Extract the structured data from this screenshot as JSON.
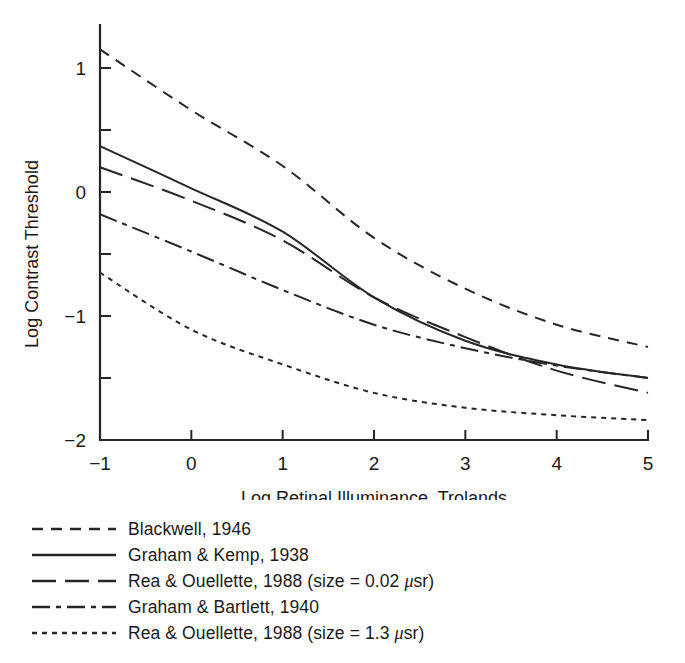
{
  "chart_data": {
    "type": "line",
    "title": "",
    "xlabel": "Log Retinal Illuminance, Trolands",
    "ylabel": "Log Contrast Threshold",
    "xlim": [
      -1,
      5
    ],
    "ylim": [
      -2,
      1
    ],
    "xticks": [
      "-1",
      "0",
      "1",
      "2",
      "3",
      "4",
      "5"
    ],
    "xtick_values": [
      -1,
      0,
      1,
      2,
      3,
      4,
      5
    ],
    "yticks": [
      "1",
      "0",
      "-1",
      "-2"
    ],
    "ytick_values": [
      1,
      0,
      -1,
      -2
    ],
    "yminor_values": [
      0.5,
      -0.5,
      -1.5
    ],
    "grid": false,
    "legend_position": "below",
    "x": [
      -1,
      0,
      1,
      2,
      3,
      4,
      5
    ],
    "series": [
      {
        "name": "Blackwell, 1946",
        "linestyle": "dashed",
        "dasharray": "11,8",
        "values": [
          1.15,
          0.66,
          0.21,
          -0.37,
          -0.78,
          -1.07,
          -1.25
        ]
      },
      {
        "name": "Graham & Kemp, 1938",
        "linestyle": "solid",
        "dasharray": "",
        "values": [
          0.37,
          0.03,
          -0.32,
          -0.85,
          -1.2,
          -1.39,
          -1.5
        ]
      },
      {
        "name": "Rea & Ouellette, 1988 (size = 0.02 µsr)",
        "linestyle": "long-dash",
        "dasharray": "24,9",
        "values": [
          0.2,
          -0.07,
          -0.39,
          -0.85,
          -1.17,
          -1.44,
          -1.62
        ]
      },
      {
        "name": "Graham & Bartlett, 1940",
        "linestyle": "dash-dot",
        "dasharray": "18,6,5,6",
        "values": [
          -0.18,
          -0.48,
          -0.79,
          -1.07,
          -1.26,
          -1.4,
          -1.5
        ]
      },
      {
        "name": "Rea & Ouellette, 1988 (size = 1.3 µsr)",
        "linestyle": "dotted",
        "dasharray": "5,5",
        "values": [
          -0.65,
          -1.11,
          -1.39,
          -1.62,
          -1.74,
          -1.8,
          -1.84
        ]
      }
    ]
  },
  "axis": {
    "x_title": "Log Retinal Illuminance, Trolands",
    "y_title": "Log Contrast Threshold",
    "x_tick_labels": [
      "−1",
      "0",
      "1",
      "2",
      "3",
      "4",
      "5"
    ],
    "y_tick_labels": [
      "1",
      "0",
      "−1",
      "−2"
    ]
  },
  "legend": {
    "items": [
      {
        "label": "Blackwell, 1946",
        "label_pre": "Blackwell, 1946",
        "label_post": "",
        "has_mu": false,
        "dasharray": "11,8"
      },
      {
        "label": "Graham & Kemp, 1938",
        "label_pre": "Graham & Kemp, 1938",
        "label_post": "",
        "has_mu": false,
        "dasharray": ""
      },
      {
        "label": "Rea & Ouellette, 1988 (size = 0.02 µsr)",
        "label_pre": "Rea & Ouellette, 1988 (size = 0.02 ",
        "label_post": "sr)",
        "has_mu": true,
        "dasharray": "24,9"
      },
      {
        "label": "Graham & Bartlett, 1940",
        "label_pre": "Graham & Bartlett, 1940",
        "label_post": "",
        "has_mu": false,
        "dasharray": "18,6,5,6"
      },
      {
        "label": "Rea & Ouellette, 1988 (size = 1.3 µsr)",
        "label_pre": "Rea & Ouellette, 1988 (size = 1.3 ",
        "label_post": "sr)",
        "has_mu": true,
        "dasharray": "5,5"
      }
    ],
    "mu_glyph": "μ"
  },
  "colors": {
    "ink": "#262626",
    "background": "#ffffff"
  }
}
